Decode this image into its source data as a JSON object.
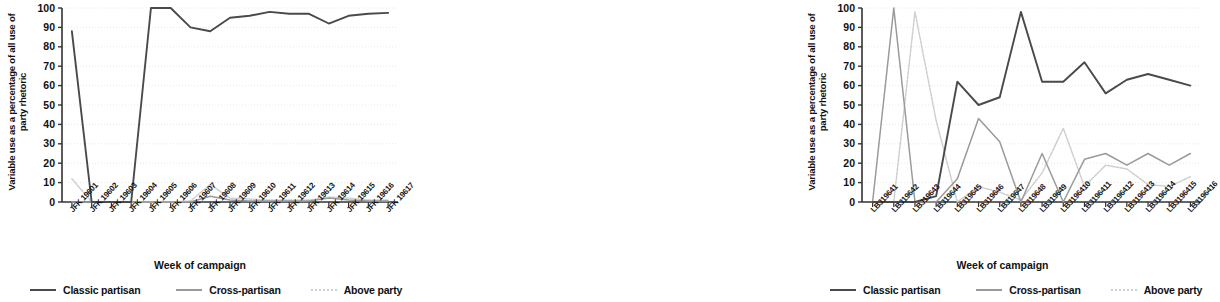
{
  "colors": {
    "classic_partisan": "#4a4a4a",
    "cross_partisan": "#9a9a9a",
    "above_party": "#cfcfcf",
    "axis": "#333333",
    "gridline": "#e2e2e2",
    "background": "#ffffff"
  },
  "legend": {
    "items": [
      {
        "label": "Classic partisan",
        "key": "classic_partisan",
        "style": "solid"
      },
      {
        "label": "Cross-partisan",
        "key": "cross_partisan",
        "style": "solid"
      },
      {
        "label": "Above party",
        "key": "above_party",
        "style": "dotted"
      }
    ]
  },
  "chart_data": [
    {
      "id": "jfk",
      "type": "line",
      "title": "",
      "xlabel": "Week of campaign",
      "ylabel": "Variable use as a percentage of all use of party rhetoric",
      "ylim": [
        0,
        100
      ],
      "yticks": [
        0,
        10,
        20,
        30,
        40,
        50,
        60,
        70,
        80,
        90,
        100
      ],
      "grid": true,
      "legend_position": "bottom",
      "categories": [
        "JFK 19601",
        "JFK 19602",
        "JFK 19603",
        "JFK 19604",
        "JFK 19605",
        "JFK 19606",
        "JFK 19607",
        "JFK 19608",
        "JFK 19609",
        "JFK 19610",
        "JFK 19611",
        "JFK 19612",
        "JFK 19613",
        "JFK 19614",
        "JFK 19615",
        "JFK 19616",
        "JFK 19617"
      ],
      "series": [
        {
          "name": "Classic partisan",
          "key": "classic_partisan",
          "values": [
            88,
            0,
            0,
            0,
            100,
            100,
            90,
            88,
            95,
            96,
            98,
            97,
            97,
            92,
            96,
            97,
            97.5
          ]
        },
        {
          "name": "Cross-partisan",
          "key": "cross_partisan",
          "values": [
            0,
            0,
            0,
            0,
            0,
            0,
            0,
            3,
            1,
            0.5,
            0.5,
            0.5,
            0.5,
            2,
            1,
            0.5,
            0.5
          ]
        },
        {
          "name": "Above party",
          "key": "above_party",
          "values": [
            12,
            0,
            0,
            0,
            0,
            0,
            0.5,
            9,
            2,
            1.5,
            1,
            1,
            1,
            2.5,
            2,
            1,
            1
          ]
        }
      ]
    },
    {
      "id": "lbj",
      "type": "line",
      "title": "",
      "xlabel": "Week of campaign",
      "ylabel": "Variable use as a percentage of all use of party rhetoric",
      "ylim": [
        0,
        100
      ],
      "yticks": [
        0,
        10,
        20,
        30,
        40,
        50,
        60,
        70,
        80,
        90,
        100
      ],
      "grid": true,
      "legend_position": "bottom",
      "categories": [
        "LBJ19641",
        "LBJ19642",
        "LBJ19643",
        "LBJ19644",
        "LBJ19645",
        "LBJ19646",
        "LBJ19647",
        "LBJ19648",
        "LBJ19649",
        "LBJ196410",
        "LBJ196411",
        "LBJ196412",
        "LBJ196413",
        "LBJ196414",
        "LBJ196415",
        "LBJ196416"
      ],
      "series": [
        {
          "name": "Classic partisan",
          "key": "classic_partisan",
          "values": [
            0,
            0,
            0,
            3,
            62,
            50,
            54,
            98,
            62,
            62,
            72,
            56,
            63,
            66,
            63,
            60,
            64
          ]
        },
        {
          "name": "Cross-partisan",
          "key": "cross_partisan",
          "values": [
            0,
            100,
            0,
            0,
            12,
            43,
            31,
            0,
            25,
            0,
            22,
            25,
            19,
            25,
            19,
            25,
            24
          ]
        },
        {
          "name": "Above party",
          "key": "above_party",
          "values": [
            0,
            0,
            98,
            42,
            0,
            8,
            5,
            1,
            15,
            38,
            8,
            19,
            17,
            9,
            8,
            13,
            10
          ]
        }
      ]
    }
  ]
}
